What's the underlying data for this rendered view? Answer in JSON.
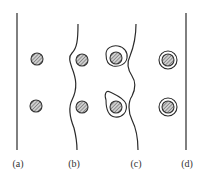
{
  "diagram": {
    "panels": [
      {
        "id": "a",
        "label": "(a)",
        "boundary": "straight"
      },
      {
        "id": "b",
        "label": "(b)",
        "boundary": "wavy"
      },
      {
        "id": "c",
        "label": "(c)",
        "boundary": "wavy-looped"
      },
      {
        "id": "d",
        "label": "(d)",
        "boundary": "straight"
      }
    ],
    "colors": {
      "stroke": "#2a2a2a",
      "particle_fill": "#b0b0b0",
      "background": "#ffffff"
    }
  }
}
